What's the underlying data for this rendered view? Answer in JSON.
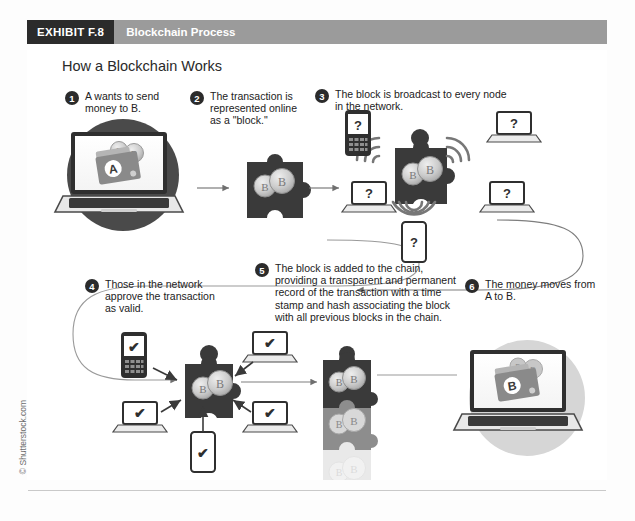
{
  "exhibit": {
    "tag": "EXHIBIT F.8",
    "title": "Blockchain Process"
  },
  "figure": {
    "title": "How a Blockchain Works",
    "steps": [
      {
        "number": "1",
        "text": "A wants to send money to B."
      },
      {
        "number": "2",
        "text": "The transaction is represented online as a \"block.\""
      },
      {
        "number": "3",
        "text": "The block is broadcast to every node in the network."
      },
      {
        "number": "4",
        "text": "Those in the network approve the transaction as valid."
      },
      {
        "number": "5",
        "text": "The block is added to the chain, providing a transparent and permanent record of the transaction with a time stamp and hash associating the block with all previous blocks in the chain."
      },
      {
        "number": "6",
        "text": "The money moves from A to B."
      }
    ],
    "art_labels": {
      "sender_wallet": "A",
      "receiver_wallet": "B",
      "bitcoin_symbol": "Ƀ",
      "unknown_node": "?",
      "approved_node": "✔"
    }
  },
  "credit": "© Shutterstock.com",
  "colors": {
    "tag_background": "#2b2b2b",
    "bar_background": "#9b9b9b",
    "bar_text": "#ffffff",
    "ink": "#222222",
    "block_dark": "#3a3a3a",
    "block_mid": "#8d8d8d",
    "block_light": "#cfcfcf",
    "coin": "#c9c9c9",
    "circle_dark": "#4a4a4a",
    "circle_light": "#d6d6d6",
    "rule": "#c9c9c9"
  }
}
